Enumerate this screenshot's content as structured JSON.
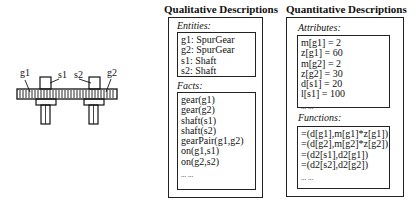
{
  "diagram": {
    "labels": {
      "g1": "g1",
      "s1": "s1",
      "s2": "s2",
      "g2": "g2"
    }
  },
  "qualitative": {
    "title": "Qualitative Descriptions",
    "entities": {
      "label": "Entities:",
      "lines": [
        "g1: SpurGear",
        "g2: SpurGear",
        "s1: Shaft",
        "s2: Shaft"
      ]
    },
    "facts": {
      "label": "Facts:",
      "lines": [
        "gear(g1)",
        "gear(g2)",
        "shaft(s1)",
        "shaft(s2)",
        "gearPair(g1,g2)",
        "on(g1,s1)",
        "on(g2,s2)",
        "... ..."
      ]
    }
  },
  "quantitative": {
    "title": "Quantitative Descriptions",
    "attributes": {
      "label": "Attributes:",
      "lines": [
        "m[g1] = 2",
        "z[g1] = 60",
        "m[g2] = 2",
        "z[g2] = 30",
        "d[s1] = 20",
        "l[s1] = 100",
        "... ..."
      ]
    },
    "functions": {
      "label": "Functions:",
      "lines": [
        "=(d[g1],m[g1]*z[g1])",
        "=(d[g2],m[g2]*z[g2])",
        "=(d2[s1],d2[g1])",
        "=(d2[s2],d2[g2])",
        "... ..."
      ]
    }
  }
}
